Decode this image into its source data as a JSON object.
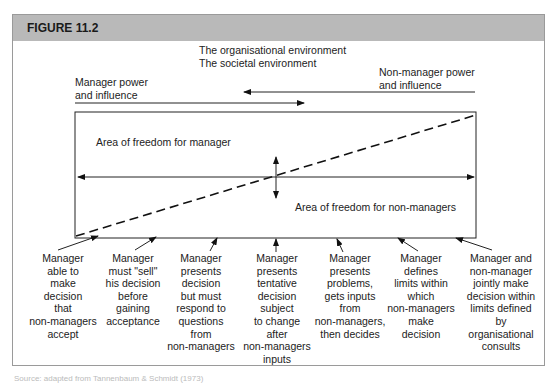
{
  "figure": {
    "title": "FIGURE 11.2",
    "env_line1": "The organisational environment",
    "env_line2": "The societal environment",
    "manager_power_line1": "Manager power",
    "manager_power_line2": "and influence",
    "nonmanager_power_line1": "Non-manager power",
    "nonmanager_power_line2": "and influence",
    "area_manager": "Area of freedom for manager",
    "area_nonmanager": "Area of freedom for non-managers",
    "columns": [
      {
        "lines": [
          "Manager",
          "able to",
          "make",
          "decision",
          "that",
          "non-managers",
          "accept"
        ]
      },
      {
        "lines": [
          "Manager",
          "must \"sell\"",
          "his decision",
          "before",
          "gaining",
          "acceptance"
        ]
      },
      {
        "lines": [
          "Manager",
          "presents",
          "decision",
          "but must",
          "respond to",
          "questions",
          "from",
          "non-managers"
        ]
      },
      {
        "lines": [
          "Manager",
          "presents",
          "tentative",
          "decision",
          "subject",
          "to change",
          "after",
          "non-managers",
          "inputs"
        ]
      },
      {
        "lines": [
          "Manager",
          "presents",
          "problems,",
          "gets inputs",
          "from",
          "non-managers,",
          "then decides"
        ]
      },
      {
        "lines": [
          "Manager",
          "defines",
          "limits within",
          "which",
          "non-managers",
          "make",
          "decision"
        ]
      },
      {
        "lines": [
          "Manager and",
          "non-manager",
          "jointly make",
          "decision within",
          "limits defined",
          "by",
          "organisational",
          "consults"
        ]
      }
    ],
    "caption": "Source: adapted from Tannenbaum & Schmidt (1973)"
  }
}
